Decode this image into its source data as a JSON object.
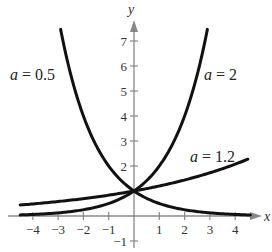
{
  "chart_data": {
    "type": "line",
    "title": "",
    "xlabel": "x",
    "ylabel": "y",
    "xlim": [
      -4.5,
      4.6
    ],
    "ylim": [
      -1.2,
      7.7
    ],
    "xticks": [
      -4,
      -3,
      -2,
      -1,
      1,
      2,
      3,
      4
    ],
    "xtick_labels": [
      "−4",
      "−3",
      "−2",
      "−1",
      "1",
      "2",
      "3",
      "4"
    ],
    "yticks": [
      -1,
      2,
      3,
      4,
      5,
      6,
      7
    ],
    "ytick_labels": [
      "−1",
      "2",
      "3",
      "4",
      "5",
      "6",
      "7"
    ],
    "grid": false,
    "series": [
      {
        "name": "a = 0.5",
        "function": "0.5^x",
        "base": 0.5,
        "x_range": [
          -2.9,
          4.6
        ],
        "label_position": "upper-left"
      },
      {
        "name": "a = 2",
        "function": "2^x",
        "base": 2,
        "x_range": [
          -4.5,
          2.9
        ],
        "label_position": "upper-right"
      },
      {
        "name": "a = 1.2",
        "function": "1.2^x",
        "base": 1.2,
        "x_range": [
          -4.5,
          4.5
        ],
        "label_position": "right"
      }
    ],
    "curve_labels": [
      {
        "var": "a",
        "eq": " = 0.5"
      },
      {
        "var": "a",
        "eq": " = 2"
      },
      {
        "var": "a",
        "eq": " = 1.2"
      }
    ]
  }
}
